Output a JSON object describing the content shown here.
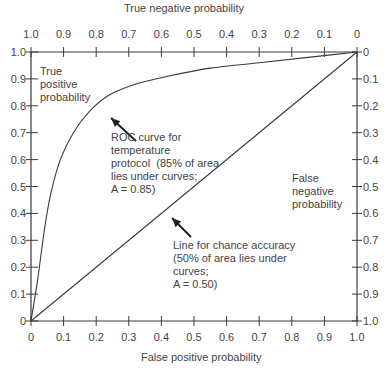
{
  "chart_data": {
    "type": "line",
    "title": "",
    "xlabel": "False positive probability",
    "ylabel": "True positive probability",
    "top_xlabel": "True negative probability",
    "right_ylabel": "False negative probability",
    "xlim": [
      0,
      1
    ],
    "ylim": [
      0,
      1
    ],
    "grid": false,
    "bottom_ticks": [
      "0",
      "0.1",
      "0.2",
      "0.3",
      "0.4",
      "0.5",
      "0.6",
      "0.7",
      "0.8",
      "0.9",
      "1.0"
    ],
    "left_ticks": [
      "0",
      "0.1",
      "0.2",
      "0.3",
      "0.4",
      "0.5",
      "0.6",
      "0.7",
      "0.8",
      "0.9",
      "1.0"
    ],
    "top_ticks": [
      "1.0",
      "0.9",
      "0.8",
      "0.7",
      "0.6",
      "0.5",
      "0.4",
      "0.3",
      "0.2",
      "0.1",
      "0"
    ],
    "right_ticks": [
      "0",
      "0.1",
      "0.2",
      "0.3",
      "0.4",
      "0.5",
      "0.6",
      "0.7",
      "0.8",
      "0.9",
      "1.0"
    ],
    "series": [
      {
        "name": "ROC curve for temperature protocol",
        "x": [
          0,
          0.02,
          0.04,
          0.06,
          0.09,
          0.13,
          0.18,
          0.24,
          0.32,
          0.42,
          0.55,
          0.7,
          0.85,
          1.0
        ],
        "y": [
          0,
          0.15,
          0.33,
          0.47,
          0.6,
          0.7,
          0.78,
          0.84,
          0.88,
          0.91,
          0.94,
          0.96,
          0.98,
          1.0
        ]
      },
      {
        "name": "Line for chance accuracy",
        "x": [
          0,
          1
        ],
        "y": [
          0,
          1
        ]
      }
    ],
    "annotations": [
      "ROC curve for temperature protocol (85% of area lies under curves; A = 0.85)",
      "Line for chance accuracy (50% of area lies under curves; A = 0.50)"
    ]
  },
  "labels": {
    "top_axis_title": "True negative probability",
    "bottom_axis_title": "False positive probability",
    "left_axis_title_lines": [
      "True",
      "positive",
      "probability"
    ],
    "right_axis_title_lines": [
      "False",
      "negative",
      "probability"
    ],
    "roc_annotation": "ROC curve for\ntemperature\nprotocol  (85% of area\nlies under curves;\nA = 0.85)",
    "chance_annotation": "Line for chance accuracy\n(50% of area lies under\ncurves;\nA = 0.50)"
  }
}
